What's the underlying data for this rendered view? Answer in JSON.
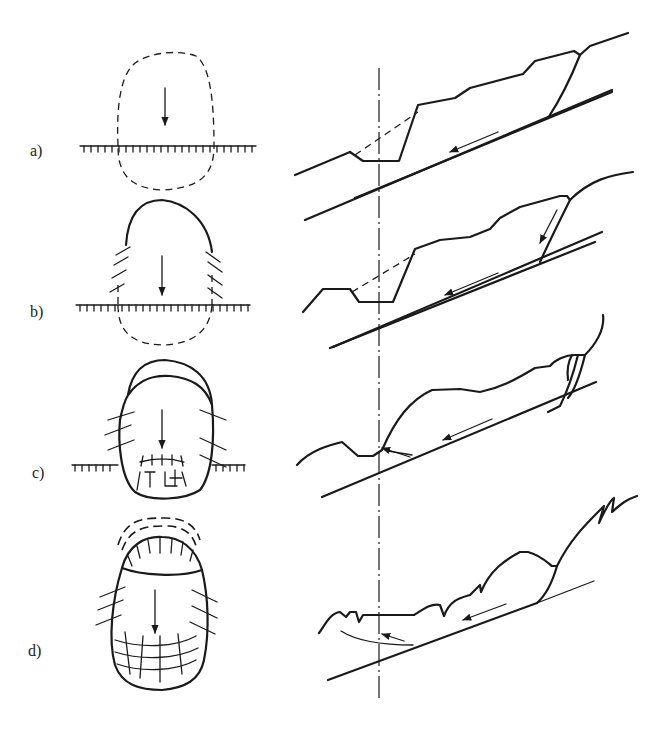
{
  "figure": {
    "panels": [
      {
        "id": "a",
        "label": "a)"
      },
      {
        "id": "b",
        "label": "b)"
      },
      {
        "id": "c",
        "label": "c)"
      },
      {
        "id": "d",
        "label": "d)"
      }
    ],
    "colors": {
      "ink": "#1a1a1a",
      "background": "#ffffff"
    }
  }
}
